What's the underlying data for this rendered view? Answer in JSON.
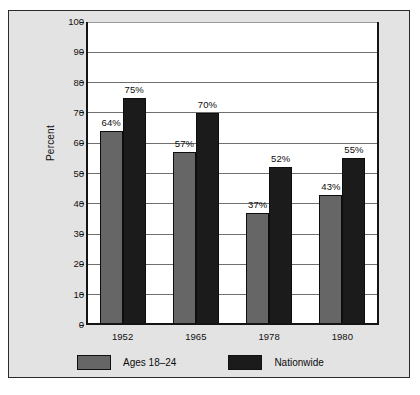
{
  "chart_data": {
    "type": "bar",
    "title": "",
    "subtitle": "",
    "xlabel": "",
    "ylabel": "Percent",
    "categories": [
      "1952",
      "1965",
      "1978",
      "1980"
    ],
    "series": [
      {
        "name": "Ages 18–24",
        "color": "#666666",
        "values": [
          64,
          57,
          37,
          43
        ],
        "labels": [
          "64%",
          "57%",
          "37%",
          "43%"
        ]
      },
      {
        "name": "Nationwide",
        "color": "#1b1b1b",
        "values": [
          75,
          70,
          52,
          55
        ],
        "labels": [
          "75%",
          "70%",
          "52%",
          "55%"
        ]
      }
    ],
    "ylim": [
      0,
      100
    ],
    "ytick_step": 10,
    "yticks": [
      0,
      10,
      20,
      30,
      40,
      50,
      60,
      70,
      80,
      90,
      100
    ],
    "ytick_labels": [
      "0",
      "10",
      "20",
      "30",
      "40",
      "50",
      "60",
      "70",
      "80",
      "90",
      "100"
    ],
    "grid": true,
    "grid_axis": "y",
    "legend_position": "bottom-left",
    "value_labels": true,
    "background_color": "#e3e3e3",
    "plot_background_color": "#ffffff",
    "axis_color": "#141414",
    "grid_color": "#6f6f6f"
  }
}
